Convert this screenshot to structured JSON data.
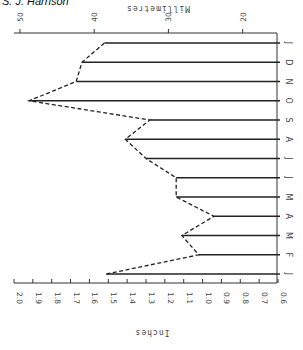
{
  "author": "S. J. Harrison",
  "chart_data": {
    "type": "line",
    "orientation": "rotated-90-clockwise",
    "title": "",
    "xlabel": "Month",
    "ylabel": "Inches",
    "ylabel_secondary": "Millimetres",
    "categories": [
      "J",
      "F",
      "M",
      "A",
      "M",
      "J",
      "J",
      "A",
      "S",
      "O",
      "N",
      "D",
      "J"
    ],
    "series": [
      {
        "name": "Monthly precipitation",
        "unit": "inches",
        "values": [
          1.51,
          1.02,
          1.11,
          0.94,
          1.14,
          1.14,
          1.3,
          1.41,
          1.28,
          1.92,
          1.67,
          1.64,
          1.52
        ]
      }
    ],
    "inch_axis": {
      "label": "Inches",
      "ticks": [
        "2.0",
        "1.9",
        "1.8",
        "1.7",
        "1.6",
        "1.5",
        "1.4",
        "1.3",
        "1.2",
        "1.1",
        "1.0",
        "0.9",
        "0.8",
        "0.7",
        "0.6"
      ],
      "range": [
        0.6,
        2.0
      ]
    },
    "mm_axis": {
      "label": "Millimetres",
      "ticks": [
        "50",
        "40",
        "30",
        "20"
      ],
      "range": [
        15.24,
        50.8
      ]
    },
    "grid": false,
    "legend": null,
    "style": "vertical bars drawn as lines from axis to value, joined by a dashed line"
  }
}
